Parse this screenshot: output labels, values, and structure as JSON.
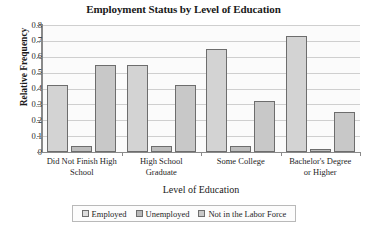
{
  "chart_data": {
    "type": "bar",
    "title": "Employment Status by Level of Education",
    "xlabel": "Level of Education",
    "ylabel": "Relative Frequency",
    "categories": [
      "Did Not Finish High School",
      "High School Graduate",
      "Some College",
      "Bachelor's Degree or Higher"
    ],
    "category_lines": [
      [
        "Did Not Finish High",
        "School"
      ],
      [
        "High School",
        "Graduate"
      ],
      [
        "Some College",
        ""
      ],
      [
        "Bachelor's Degree",
        "or Higher"
      ]
    ],
    "series": [
      {
        "name": "Employed",
        "values": [
          0.42,
          0.55,
          0.65,
          0.73
        ],
        "color": "#d3d3d3"
      },
      {
        "name": "Unemployed",
        "values": [
          0.04,
          0.035,
          0.04,
          0.02
        ],
        "color": "#bdbdbd"
      },
      {
        "name": "Not in the Labor Force",
        "values": [
          0.55,
          0.42,
          0.32,
          0.25
        ],
        "color": "#c8c8c8"
      }
    ],
    "ylim": [
      0,
      0.8
    ],
    "yticks": [
      "0",
      "0.1",
      "0.2",
      "0.3",
      "0.4",
      "0.5",
      "0.6",
      "0.7",
      "0.8"
    ],
    "ytick_values": [
      0,
      0.1,
      0.2,
      0.3,
      0.4,
      0.5,
      0.6,
      0.7,
      0.8
    ],
    "grid": true,
    "legend_position": "bottom",
    "legend": [
      "Employed",
      "Unemployed",
      "Not in the Labor Force"
    ]
  },
  "colors": {
    "axis": "#8a8a8a",
    "grid": "#cfcfcf",
    "bar_border": "#6d6d6d",
    "text": "#1f1f1f",
    "plot_background": "#fbfbfb"
  }
}
